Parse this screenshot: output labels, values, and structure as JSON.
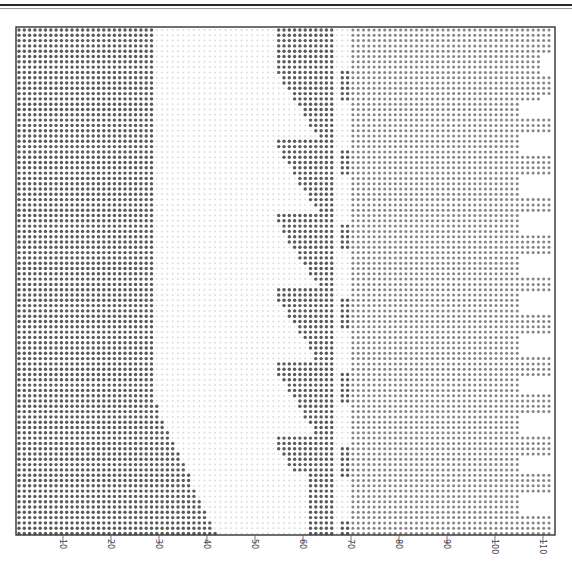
{
  "figure": {
    "type": "dot-matrix grid printout",
    "frame": {
      "left": 16,
      "top": 27,
      "right": 555,
      "bottom": 535
    },
    "x_axis": {
      "ticks": [
        10,
        20,
        30,
        40,
        50,
        60,
        70,
        80,
        90,
        100,
        110
      ],
      "tick_labels": [
        "10",
        "20",
        "30",
        "40",
        "50",
        "60",
        "70",
        "80",
        "90",
        "100",
        "110"
      ],
      "px_at_zero": 15,
      "px_per_unit": 4.8,
      "label_orientation": "rotated 90°"
    },
    "dot_pitch": 5.3,
    "colors": {
      "dark_dot": "#5a5a5a",
      "medium_dot": "#858585",
      "faint_dot": "#dcdcdc",
      "frame": "#333333",
      "background": "#ffffff"
    },
    "regions": [
      {
        "name": "left-dense-block",
        "x_range": [
          0,
          28.5
        ],
        "shade": "dark",
        "note": "widens diagonally below y≈395 to x≈42 at bottom"
      },
      {
        "name": "central-light-gap",
        "x_range": [
          28.5,
          54
        ],
        "shade": "faint"
      },
      {
        "name": "chevron-column",
        "x_range": [
          54,
          65.5
        ],
        "shade": "dark",
        "note": "repeating diagonal chevrons with period ≈75px"
      },
      {
        "name": "narrow-column",
        "x_range": [
          62.5,
          65.5
        ],
        "shade": "dark"
      },
      {
        "name": "right-medium-block",
        "x_range": [
          69,
          112
        ],
        "shade": "medium"
      },
      {
        "name": "right-notched-strip",
        "x_range": [
          105,
          112
        ],
        "shade": "medium",
        "note": "periodic white notches ≈40px period"
      }
    ]
  },
  "chart_data": {
    "type": "heatmap",
    "title": "",
    "xlabel": "",
    "ylabel": "",
    "xlim": [
      0,
      112
    ],
    "x_ticks": [
      10,
      20,
      30,
      40,
      50,
      60,
      70,
      80,
      90,
      100,
      110
    ],
    "grid": false,
    "legend": null
  }
}
